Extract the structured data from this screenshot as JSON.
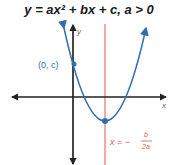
{
  "title": "y = ax² + bx + c, a > 0",
  "axes": {
    "x_label": "x",
    "y_label": "y"
  },
  "labels": {
    "y_intercept": "(0, c)",
    "axis_of_symmetry_prefix": "x = −",
    "axis_of_symmetry_num": "b",
    "axis_of_symmetry_den": "2a"
  },
  "colors": {
    "parabola": "#2f6fb0",
    "axis_of_symmetry": "#e2574c",
    "axes": "#222222",
    "label_blue": "#2f6fb0",
    "label_red": "#e2574c"
  }
}
